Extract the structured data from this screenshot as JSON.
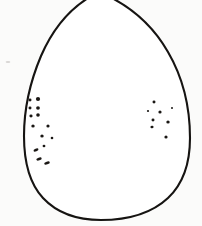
{
  "figure": {
    "type": "line-drawing",
    "caption": "",
    "width": 202,
    "height": 226,
    "background_color": "#fefefe",
    "ink_color": "#161412",
    "speckle_color": "#1a1714"
  },
  "outline": {
    "name": "egg-ovoid-contour",
    "stroke_color": "#161412",
    "stroke_width": 2.1,
    "fill_color": "#ffffff",
    "apex_x": 100,
    "apex_y": -6,
    "left_extreme_x": 24,
    "right_extreme_x": 190,
    "widest_y": 150,
    "bottom_y": 219,
    "path": "M 99 -8 C 74 4 54 26 41 56 C 30 82 24 110 24 136 C 24 163 30 184 43 198 C 57 213 77 220 101 220 C 128 220 152 213 168 198 C 183 184 190 164 190 138 C 190 106 182 76 168 52 C 152 24 128 4 99 -8 Z"
  },
  "speckle_clusters": [
    {
      "name": "left-speckle-cluster",
      "count": 14,
      "dots": [
        {
          "cx": 30,
          "cy": 100,
          "rx": 1.5,
          "ry": 1.4,
          "rot": 0
        },
        {
          "cx": 38,
          "cy": 99,
          "rx": 2.1,
          "ry": 1.9,
          "rot": 0
        },
        {
          "cx": 30,
          "cy": 108,
          "rx": 1.5,
          "ry": 1.4,
          "rot": 0
        },
        {
          "cx": 38,
          "cy": 108,
          "rx": 1.9,
          "ry": 1.7,
          "rot": 0
        },
        {
          "cx": 31,
          "cy": 116,
          "rx": 1.6,
          "ry": 1.4,
          "rot": 0
        },
        {
          "cx": 38,
          "cy": 115,
          "rx": 1.8,
          "ry": 1.7,
          "rot": 0
        },
        {
          "cx": 33,
          "cy": 126,
          "rx": 1.7,
          "ry": 1.5,
          "rot": 0
        },
        {
          "cx": 48,
          "cy": 126,
          "rx": 1.6,
          "ry": 1.5,
          "rot": 0
        },
        {
          "cx": 42,
          "cy": 136,
          "rx": 1.7,
          "ry": 1.5,
          "rot": 0
        },
        {
          "cx": 52,
          "cy": 138,
          "rx": 1.3,
          "ry": 1.2,
          "rot": 0
        },
        {
          "cx": 36,
          "cy": 150,
          "rx": 2.6,
          "ry": 1.3,
          "rot": -22
        },
        {
          "cx": 44,
          "cy": 146,
          "rx": 1.4,
          "ry": 1.2,
          "rot": 0
        },
        {
          "cx": 39,
          "cy": 159,
          "rx": 2.8,
          "ry": 1.4,
          "rot": -18
        },
        {
          "cx": 47,
          "cy": 163,
          "rx": 2.9,
          "ry": 1.4,
          "rot": -16
        }
      ]
    },
    {
      "name": "right-speckle-cluster",
      "count": 8,
      "dots": [
        {
          "cx": 154,
          "cy": 102,
          "rx": 1.5,
          "ry": 1.4,
          "rot": 0
        },
        {
          "cx": 160,
          "cy": 112,
          "rx": 1.6,
          "ry": 1.5,
          "rot": 0
        },
        {
          "cx": 153,
          "cy": 120,
          "rx": 1.5,
          "ry": 1.4,
          "rot": 0
        },
        {
          "cx": 152,
          "cy": 127,
          "rx": 1.6,
          "ry": 1.3,
          "rot": -12
        },
        {
          "cx": 168,
          "cy": 122,
          "rx": 1.7,
          "ry": 1.6,
          "rot": 0
        },
        {
          "cx": 166,
          "cy": 137,
          "rx": 1.6,
          "ry": 1.5,
          "rot": 0
        },
        {
          "cx": 148,
          "cy": 111,
          "rx": 1.1,
          "ry": 1.0,
          "rot": 0
        },
        {
          "cx": 172,
          "cy": 108,
          "rx": 1.0,
          "ry": 1.0,
          "rot": 0
        }
      ]
    }
  ],
  "faint_marks": [
    {
      "name": "faint-mark-upper-center",
      "cx": 107,
      "cy": 62,
      "rx": 2.0,
      "ry": 1.0
    },
    {
      "name": "faint-mark-upper-right",
      "cx": 147,
      "cy": 58,
      "rx": 1.6,
      "ry": 0.9
    },
    {
      "name": "faint-mark-mid-center",
      "cx": 96,
      "cy": 120,
      "rx": 2.2,
      "ry": 1.1
    },
    {
      "name": "faint-mark-left-edge",
      "cx": 8,
      "cy": 62,
      "rx": 2.4,
      "ry": 1.0
    }
  ]
}
